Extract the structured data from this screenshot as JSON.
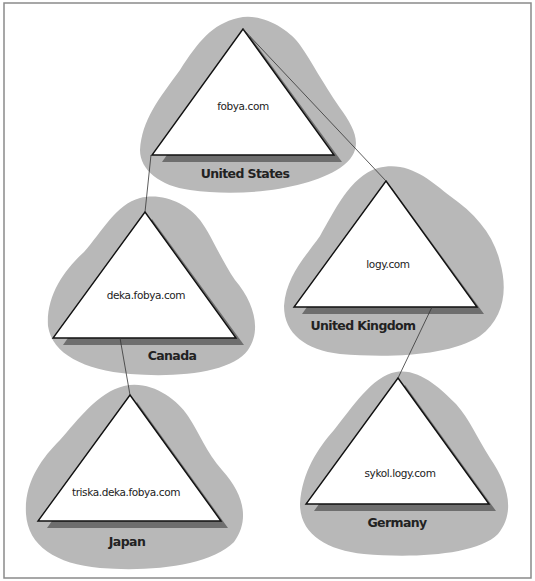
{
  "diagram": {
    "type": "domain-tree",
    "colors": {
      "blob": "#b8b8b8",
      "triangle_fill": "#ffffff",
      "triangle_stroke": "#111111",
      "shadow": "#6e6e6e",
      "connector": "#333333",
      "frame": "#8a8a8a"
    },
    "nodes": [
      {
        "id": "us",
        "domain": "fobya.com",
        "country": "United States"
      },
      {
        "id": "ca",
        "domain": "deka.fobya.com",
        "country": "Canada"
      },
      {
        "id": "uk",
        "domain": "logy.com",
        "country": "United Kingdom"
      },
      {
        "id": "jp",
        "domain": "triska.deka.fobya.com",
        "country": "Japan"
      },
      {
        "id": "de",
        "domain": "sykol.logy.com",
        "country": "Germany"
      }
    ],
    "edges": [
      {
        "from": "fobya.com",
        "to": "logy.com"
      },
      {
        "from": "fobya.com",
        "to": "deka.fobya.com"
      },
      {
        "from": "deka.fobya.com",
        "to": "triska.deka.fobya.com"
      },
      {
        "from": "logy.com",
        "to": "sykol.logy.com"
      }
    ]
  }
}
